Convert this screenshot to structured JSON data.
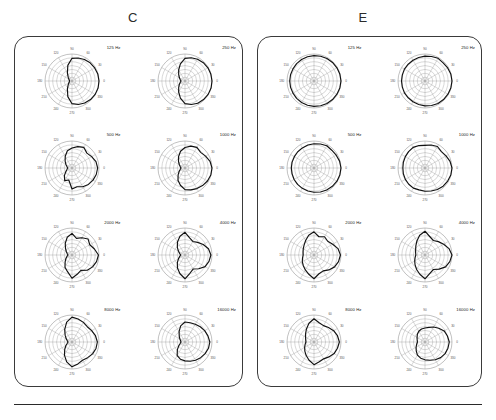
{
  "figure": {
    "background_color": "#ffffff",
    "trace_color": "#111111",
    "grid_color": "#8d8d8d",
    "panel_border_color": "#3a3a3a"
  },
  "panels": [
    {
      "id": "panel-c",
      "label": "C",
      "label_x": 133,
      "label_y": 12,
      "box": {
        "x": 14,
        "y": 36,
        "w": 229,
        "h": 351
      }
    },
    {
      "id": "panel-e",
      "label": "E",
      "label_x": 363,
      "label_y": 12,
      "box": {
        "x": 257,
        "y": 36,
        "w": 225,
        "h": 351
      }
    }
  ],
  "polar_axis": {
    "angle_ticks": [
      "0",
      "30",
      "60",
      "90",
      "120",
      "150",
      "180",
      "210",
      "240",
      "270",
      "300",
      "330"
    ],
    "ring_count": 7,
    "spoke_count": 12,
    "spoke_step_deg": 30
  },
  "frequencies": [
    "125 Hz",
    "250 Hz",
    "500 Hz",
    "1000 Hz",
    "2000 Hz",
    "4000 Hz",
    "8000 Hz",
    "16000 Hz"
  ],
  "chart_data": {
    "type": "line",
    "title": "",
    "subtitle": "",
    "xlabel": "Angle (degrees)",
    "ylabel": "Relative level",
    "grid": true,
    "legend_position": "none",
    "coordinate_system": "polar",
    "theta_deg": [
      0,
      15,
      30,
      45,
      60,
      75,
      90,
      105,
      120,
      135,
      150,
      165,
      180,
      195,
      210,
      225,
      240,
      255,
      270,
      285,
      300,
      315,
      330,
      345
    ],
    "rlim": [
      0,
      1
    ],
    "charts": [
      {
        "panel": "C",
        "title": "125 Hz",
        "values": [
          1.0,
          0.99,
          0.97,
          0.95,
          0.92,
          0.88,
          0.84,
          0.6,
          0.34,
          0.2,
          0.13,
          0.1,
          0.09,
          0.1,
          0.13,
          0.2,
          0.34,
          0.6,
          0.84,
          0.9,
          0.94,
          0.97,
          0.99,
          1.0
        ]
      },
      {
        "panel": "C",
        "title": "250 Hz",
        "values": [
          1.0,
          0.99,
          0.98,
          0.96,
          0.93,
          0.89,
          0.84,
          0.66,
          0.47,
          0.33,
          0.24,
          0.18,
          0.15,
          0.18,
          0.24,
          0.33,
          0.47,
          0.66,
          0.84,
          0.9,
          0.95,
          0.97,
          0.99,
          1.0
        ]
      },
      {
        "panel": "C",
        "title": "500 Hz",
        "values": [
          0.95,
          0.92,
          0.84,
          0.78,
          0.88,
          0.82,
          0.74,
          0.66,
          0.5,
          0.36,
          0.26,
          0.19,
          0.16,
          0.19,
          0.26,
          0.4,
          0.54,
          0.46,
          0.78,
          0.72,
          0.8,
          0.86,
          0.9,
          0.93
        ]
      },
      {
        "panel": "C",
        "title": "1000 Hz",
        "values": [
          1.0,
          0.96,
          0.88,
          0.82,
          0.88,
          0.84,
          0.76,
          0.64,
          0.48,
          0.34,
          0.24,
          0.18,
          0.15,
          0.18,
          0.25,
          0.36,
          0.52,
          0.66,
          0.8,
          0.84,
          0.88,
          0.92,
          0.96,
          0.99
        ]
      },
      {
        "panel": "C",
        "title": "2000 Hz",
        "values": [
          0.98,
          0.86,
          0.76,
          0.84,
          0.74,
          0.64,
          0.8,
          0.68,
          0.5,
          0.34,
          0.24,
          0.18,
          0.15,
          0.19,
          0.26,
          0.36,
          0.52,
          0.64,
          0.86,
          0.74,
          0.66,
          0.8,
          0.88,
          0.94
        ]
      },
      {
        "panel": "C",
        "title": "4000 Hz",
        "values": [
          0.96,
          0.9,
          0.78,
          0.66,
          0.58,
          0.66,
          0.84,
          0.72,
          0.56,
          0.4,
          0.28,
          0.2,
          0.16,
          0.2,
          0.28,
          0.4,
          0.56,
          0.72,
          0.88,
          0.7,
          0.6,
          0.72,
          0.86,
          0.92
        ]
      },
      {
        "panel": "C",
        "title": "8000 Hz",
        "values": [
          0.94,
          0.9,
          0.84,
          0.8,
          0.84,
          0.88,
          0.92,
          0.76,
          0.54,
          0.36,
          0.25,
          0.18,
          0.15,
          0.18,
          0.26,
          0.38,
          0.56,
          0.76,
          0.92,
          0.84,
          0.78,
          0.82,
          0.88,
          0.92
        ]
      },
      {
        "panel": "C",
        "title": "16000 Hz",
        "values": [
          0.92,
          0.88,
          0.84,
          0.8,
          0.76,
          0.74,
          0.74,
          0.62,
          0.44,
          0.3,
          0.22,
          0.17,
          0.15,
          0.18,
          0.26,
          0.4,
          0.58,
          0.66,
          0.7,
          0.74,
          0.78,
          0.82,
          0.86,
          0.9
        ]
      },
      {
        "panel": "E",
        "title": "125 Hz",
        "values": [
          1.0,
          0.99,
          0.98,
          0.97,
          0.96,
          0.95,
          0.94,
          0.93,
          0.92,
          0.91,
          0.9,
          0.9,
          0.9,
          0.9,
          0.9,
          0.91,
          0.92,
          0.93,
          0.94,
          0.95,
          0.96,
          0.97,
          0.98,
          0.99
        ]
      },
      {
        "panel": "E",
        "title": "250 Hz",
        "values": [
          1.0,
          0.99,
          0.97,
          0.95,
          0.97,
          0.94,
          0.92,
          0.9,
          0.89,
          0.88,
          0.88,
          0.87,
          0.87,
          0.87,
          0.88,
          0.88,
          0.89,
          0.9,
          0.92,
          0.94,
          0.96,
          0.97,
          0.98,
          0.99
        ]
      },
      {
        "panel": "E",
        "title": "500 Hz",
        "values": [
          1.0,
          0.98,
          0.95,
          0.93,
          0.95,
          0.92,
          0.9,
          0.88,
          0.86,
          0.85,
          0.84,
          0.84,
          0.84,
          0.84,
          0.85,
          0.86,
          0.87,
          0.88,
          0.9,
          0.92,
          0.94,
          0.96,
          0.98,
          0.99
        ]
      },
      {
        "panel": "E",
        "title": "1000 Hz",
        "values": [
          1.0,
          0.96,
          0.9,
          0.86,
          0.92,
          0.88,
          0.84,
          0.86,
          0.88,
          0.86,
          0.84,
          0.83,
          0.82,
          0.83,
          0.84,
          0.85,
          0.86,
          0.84,
          0.86,
          0.88,
          0.92,
          0.95,
          0.97,
          0.99
        ]
      },
      {
        "panel": "E",
        "title": "2000 Hz",
        "values": [
          0.98,
          0.92,
          0.8,
          0.72,
          0.78,
          0.7,
          0.86,
          0.76,
          0.62,
          0.52,
          0.46,
          0.42,
          0.4,
          0.44,
          0.5,
          0.56,
          0.64,
          0.74,
          0.88,
          0.72,
          0.68,
          0.78,
          0.88,
          0.94
        ]
      },
      {
        "panel": "E",
        "title": "4000 Hz",
        "values": [
          1.0,
          0.92,
          0.8,
          0.7,
          0.62,
          0.7,
          0.88,
          0.76,
          0.6,
          0.48,
          0.4,
          0.36,
          0.34,
          0.38,
          0.44,
          0.52,
          0.62,
          0.74,
          0.88,
          0.7,
          0.62,
          0.74,
          0.88,
          0.95
        ]
      },
      {
        "panel": "E",
        "title": "8000 Hz",
        "values": [
          0.94,
          0.9,
          0.84,
          0.76,
          0.7,
          0.74,
          0.86,
          0.72,
          0.56,
          0.44,
          0.36,
          0.32,
          0.3,
          0.34,
          0.4,
          0.48,
          0.58,
          0.7,
          0.84,
          0.76,
          0.72,
          0.78,
          0.86,
          0.9
        ]
      },
      {
        "panel": "E",
        "title": "16000 Hz",
        "values": [
          0.9,
          0.86,
          0.82,
          0.72,
          0.64,
          0.56,
          0.52,
          0.5,
          0.46,
          0.4,
          0.34,
          0.3,
          0.28,
          0.32,
          0.38,
          0.46,
          0.56,
          0.62,
          0.66,
          0.7,
          0.76,
          0.82,
          0.86,
          0.88
        ]
      }
    ]
  },
  "bottom_rule": {
    "y": 404
  }
}
